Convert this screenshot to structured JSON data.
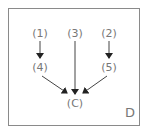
{
  "diagram": {
    "corner_label": "D",
    "nodes": [
      {
        "id": "n1",
        "label": "(1)"
      },
      {
        "id": "n3",
        "label": "(3)"
      },
      {
        "id": "n2",
        "label": "(2)"
      },
      {
        "id": "n4",
        "label": "(4)"
      },
      {
        "id": "n5",
        "label": "(5)"
      },
      {
        "id": "nC",
        "label": "(C)"
      }
    ],
    "edges": [
      {
        "from": "(1)",
        "to": "(4)"
      },
      {
        "from": "(2)",
        "to": "(5)"
      },
      {
        "from": "(3)",
        "to": "(C)"
      },
      {
        "from": "(4)",
        "to": "(C)"
      },
      {
        "from": "(5)",
        "to": "(C)"
      }
    ]
  }
}
